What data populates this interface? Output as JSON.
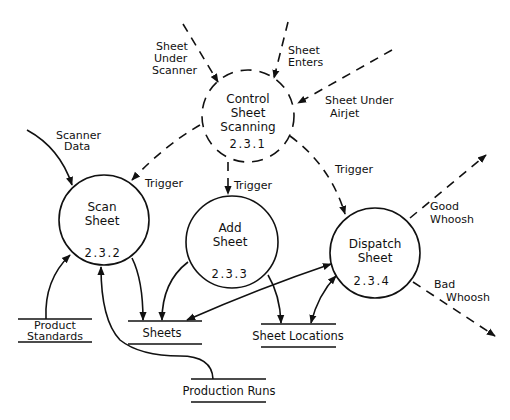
{
  "diagram": {
    "type": "data-flow-diagram",
    "processes": [
      {
        "id": "2.3.1",
        "name_lines": [
          "Control",
          "Sheet",
          "Scanning"
        ],
        "number": "2.3.1",
        "style": "dashed"
      },
      {
        "id": "2.3.2",
        "name_lines": [
          "Scan",
          "Sheet"
        ],
        "number": "2.3.2",
        "style": "solid"
      },
      {
        "id": "2.3.3",
        "name_lines": [
          "Add",
          "Sheet"
        ],
        "number": "2.3.3",
        "style": "solid"
      },
      {
        "id": "2.3.4",
        "name_lines": [
          "Dispatch",
          "Sheet"
        ],
        "number": "2.3.4",
        "style": "solid"
      }
    ],
    "stores": [
      {
        "id": "product-standards",
        "label_lines": [
          "Product",
          "Standards"
        ]
      },
      {
        "id": "sheets",
        "label": "Sheets"
      },
      {
        "id": "sheet-locations",
        "label": "Sheet Locations"
      },
      {
        "id": "production-runs",
        "label": "Production Runs"
      }
    ],
    "flows": {
      "sheet_under_scanner": [
        "Sheet",
        "Under",
        "Scanner"
      ],
      "sheet_enters": [
        "Sheet",
        "Enters"
      ],
      "sheet_under_airjet": [
        "Sheet Under",
        "Airjet"
      ],
      "scanner_data": [
        "Scanner",
        "Data"
      ],
      "trigger_scan": "Trigger",
      "trigger_add": "Trigger",
      "trigger_dispatch": "Trigger",
      "good_whoosh": [
        "Good",
        "Whoosh"
      ],
      "bad_whoosh": [
        "Bad",
        "Whoosh"
      ]
    }
  }
}
